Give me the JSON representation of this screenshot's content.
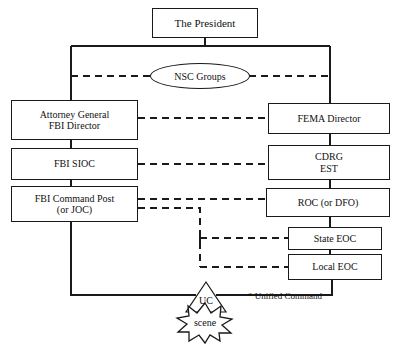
{
  "diagram": {
    "style": {
      "line_color": "#1a1a1a",
      "box_fill": "#ffffff",
      "background": "#ffffff"
    },
    "nodes": [
      {
        "id": "president",
        "label": "The President",
        "lines": [
          "The President"
        ],
        "shape": "box"
      },
      {
        "id": "nsc",
        "label": "NSC Groups",
        "lines": [
          "NSC Groups"
        ],
        "shape": "ellipse"
      },
      {
        "id": "ag_fbi",
        "label": "Attorney General / FBI Director",
        "lines": [
          "Attorney General",
          "FBI Director"
        ],
        "shape": "box"
      },
      {
        "id": "fema",
        "label": "FEMA Director",
        "lines": [
          "FEMA Director"
        ],
        "shape": "box"
      },
      {
        "id": "fbi_sioc",
        "label": "FBI SIOC",
        "lines": [
          "FBI SIOC"
        ],
        "shape": "box"
      },
      {
        "id": "cdrg_est",
        "label": "CDRG EST",
        "lines": [
          "CDRG",
          "EST"
        ],
        "shape": "box"
      },
      {
        "id": "fbi_cp",
        "label": "FBI Command Post (or JOC)",
        "lines": [
          "FBI Command Post",
          "(or JOC)"
        ],
        "shape": "box"
      },
      {
        "id": "roc_dfo",
        "label": "ROC (or DFO)",
        "lines": [
          "ROC (or DFO)"
        ],
        "shape": "box"
      },
      {
        "id": "state_eoc",
        "label": "State EOC",
        "lines": [
          "State EOC"
        ],
        "shape": "box"
      },
      {
        "id": "local_eoc",
        "label": "Local EOC",
        "lines": [
          "Local EOC"
        ],
        "shape": "box"
      },
      {
        "id": "uc",
        "label": "UC",
        "lines": [
          "UC"
        ],
        "shape": "triangle"
      },
      {
        "id": "scene",
        "label": "scene",
        "lines": [
          "scene"
        ],
        "shape": "starburst"
      }
    ],
    "footnote": "* Unified Command",
    "edges": [
      {
        "from": "president",
        "to": "ag_fbi",
        "style": "solid"
      },
      {
        "from": "president",
        "to": "fema",
        "style": "solid"
      },
      {
        "from": "ag_fbi",
        "to": "nsc",
        "style": "dashed"
      },
      {
        "from": "fema",
        "to": "nsc",
        "style": "dashed"
      },
      {
        "from": "ag_fbi",
        "to": "fema",
        "style": "dashed"
      },
      {
        "from": "ag_fbi",
        "to": "fbi_sioc",
        "style": "solid"
      },
      {
        "from": "fema",
        "to": "cdrg_est",
        "style": "solid"
      },
      {
        "from": "fbi_sioc",
        "to": "cdrg_est",
        "style": "dashed"
      },
      {
        "from": "fbi_sioc",
        "to": "fbi_cp",
        "style": "solid"
      },
      {
        "from": "cdrg_est",
        "to": "roc_dfo",
        "style": "solid"
      },
      {
        "from": "fbi_cp",
        "to": "roc_dfo",
        "style": "dashed"
      },
      {
        "from": "fbi_cp",
        "to": "state_eoc",
        "style": "dashed"
      },
      {
        "from": "fbi_cp",
        "to": "local_eoc",
        "style": "dashed"
      },
      {
        "from": "roc_dfo",
        "to": "state_eoc",
        "style": "solid"
      },
      {
        "from": "state_eoc",
        "to": "local_eoc",
        "style": "solid"
      },
      {
        "from": "fbi_cp",
        "to": "uc",
        "style": "solid"
      },
      {
        "from": "local_eoc",
        "to": "uc",
        "style": "solid"
      },
      {
        "from": "uc",
        "to": "scene",
        "style": "implied"
      }
    ]
  }
}
